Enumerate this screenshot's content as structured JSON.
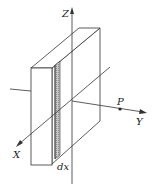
{
  "figure": {
    "labels": {
      "z_axis": "Z",
      "y_axis": "Y",
      "x_axis": "X",
      "point": "P",
      "strip": "dx"
    },
    "colors": {
      "line": "#333333",
      "strip_fill": "#bdbdbd",
      "background": "#ffffff"
    }
  }
}
